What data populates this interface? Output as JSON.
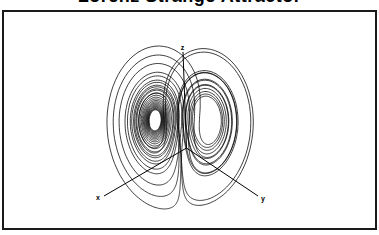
{
  "figure": {
    "background_color": "#ffffff",
    "frame_border_color": "#1b1b1b",
    "line_color": "#000000"
  },
  "chart_data": {
    "type": "line",
    "title": "Lorenz Strange Attractor",
    "model": "lorenz",
    "parameters": {
      "sigma": 10,
      "rho": 28,
      "beta": 2.6666667
    },
    "initial_state": {
      "x": 0,
      "y": 1,
      "z": 1.05
    },
    "integration": {
      "dt": 0.005,
      "steps": 5800,
      "discard": 300
    },
    "axis_labels": {
      "x": "x",
      "y": "y",
      "z": "z"
    },
    "grid": false,
    "legend": null,
    "line_width": 0.75,
    "layout_hints": {
      "projection": {
        "sx_offset": 181,
        "sx_per_y": 3.05,
        "sy_offset": 232,
        "sy_per_z": -4.15
      },
      "plot_clip": {
        "x": 4.5,
        "y": 12,
        "width": 370,
        "height": 214
      },
      "axes_triad": {
        "origin": [
          186.5,
          148
        ],
        "z_top": [
          183,
          52
        ],
        "x_end": [
          104,
          196
        ],
        "y_end": [
          258,
          196
        ],
        "x_label_pos": [
          98,
          200
        ],
        "y_label_pos": [
          263,
          201
        ],
        "z_label_pos": [
          182.5,
          50
        ]
      }
    }
  }
}
